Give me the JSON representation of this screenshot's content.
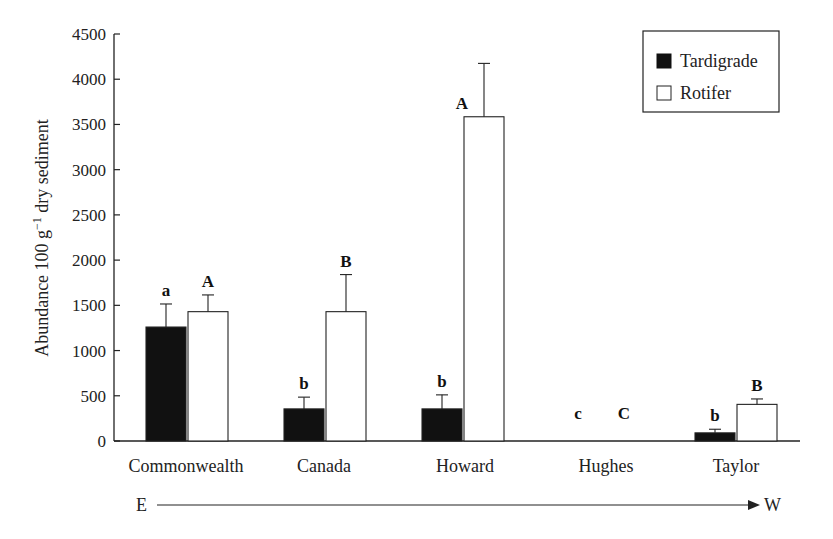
{
  "chart_data": {
    "type": "bar",
    "title": "",
    "xlabel": "",
    "ylabel": "Abundance 100 g⁻¹ dry sediment",
    "ylabel_parts": {
      "main": "Abundance  100 g",
      "sup": "−1",
      "tail": " dry sediment"
    },
    "ylim": [
      0,
      4500
    ],
    "yticks": [
      0,
      500,
      1000,
      1500,
      2000,
      2500,
      3000,
      3500,
      4000,
      4500
    ],
    "grid": false,
    "legend_position": "top-right",
    "categories": [
      "Commonwealth",
      "Canada",
      "Howard",
      "Hughes",
      "Taylor"
    ],
    "series": [
      {
        "name": "Tardigrade",
        "fill": "#111111",
        "values": [
          1260,
          355,
          355,
          0,
          90
        ],
        "error_upper": [
          1515,
          485,
          510,
          null,
          130
        ],
        "significance": [
          "a",
          "b",
          "b",
          "c",
          "b"
        ]
      },
      {
        "name": "Rotifer",
        "fill": "#ffffff",
        "values": [
          1430,
          1430,
          3585,
          0,
          405
        ],
        "error_upper": [
          1615,
          1840,
          4175,
          null,
          465
        ],
        "significance": [
          "A",
          "B",
          "A",
          "C",
          "B"
        ]
      }
    ],
    "direction_axis": {
      "start": "E",
      "end": "W"
    }
  },
  "legend": {
    "items": [
      {
        "label": "Tardigrade",
        "fill": "#111111"
      },
      {
        "label": "Rotifer",
        "fill": "#ffffff"
      }
    ]
  }
}
